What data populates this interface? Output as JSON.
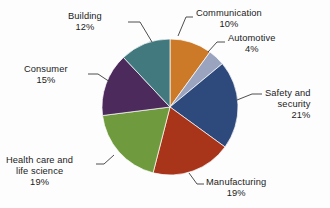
{
  "chart_data": {
    "type": "pie",
    "title": "",
    "subtitle": "",
    "xlabel": "",
    "ylabel": "",
    "legend_position": "none",
    "grid": false,
    "units": "percent",
    "start_angle_deg": 0,
    "direction": "clockwise",
    "categories": [
      "Communication",
      "Automotive",
      "Safety and security",
      "Manufacturing",
      "Health care and life science",
      "Consumer",
      "Building"
    ],
    "values": [
      10,
      4,
      21,
      19,
      19,
      15,
      12
    ],
    "colors": [
      "#CC7A28",
      "#9AA4BE",
      "#2E4A7D",
      "#A8341A",
      "#709A3E",
      "#4C2A5C",
      "#42797E"
    ],
    "slices": [
      {
        "label": "Communication",
        "value": 10,
        "percent_text": "10%",
        "color": "#CC7A28",
        "label_lines": [
          "Communication"
        ]
      },
      {
        "label": "Automotive",
        "value": 4,
        "percent_text": "4%",
        "color": "#9AA4BE",
        "label_lines": [
          "Automotive"
        ]
      },
      {
        "label": "Safety and security",
        "value": 21,
        "percent_text": "21%",
        "color": "#2E4A7D",
        "label_lines": [
          "Safety and",
          "security"
        ]
      },
      {
        "label": "Manufacturing",
        "value": 19,
        "percent_text": "19%",
        "color": "#A8341A",
        "label_lines": [
          "Manufacturing"
        ]
      },
      {
        "label": "Health care and life science",
        "value": 19,
        "percent_text": "19%",
        "color": "#709A3E",
        "label_lines": [
          "Health care and",
          "life science"
        ]
      },
      {
        "label": "Consumer",
        "value": 15,
        "percent_text": "15%",
        "color": "#4C2A5C",
        "label_lines": [
          "Consumer"
        ]
      },
      {
        "label": "Building",
        "value": 12,
        "percent_text": "12%",
        "color": "#42797E",
        "label_lines": [
          "Building"
        ]
      }
    ]
  },
  "labels": {
    "communication": {
      "name": "Communication",
      "pct": "10%"
    },
    "automotive": {
      "name": "Automotive",
      "pct": "4%"
    },
    "safety": {
      "name_line1": "Safety and",
      "name_line2": "security",
      "pct": "21%"
    },
    "manufacturing": {
      "name": "Manufacturing",
      "pct": "19%"
    },
    "health": {
      "name_line1": "Health care and",
      "name_line2": "life science",
      "pct": "19%"
    },
    "consumer": {
      "name": "Consumer",
      "pct": "15%"
    },
    "building": {
      "name": "Building",
      "pct": "12%"
    }
  },
  "geometry": {
    "center_x": 170,
    "center_y": 107,
    "radius": 68
  }
}
